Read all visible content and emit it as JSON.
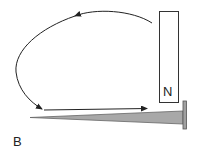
{
  "diagram": {
    "panel_label": "B",
    "magnet": {
      "pole_label": "N",
      "fill": "#ffffff",
      "stroke": "#333333"
    },
    "nail": {
      "fill": "#a8a8a8",
      "stroke": "#555555"
    },
    "field_lines": {
      "color": "#222222",
      "description": "Curved field line leaves the magnet's far end, arcs left and down to the nail tip, then a straight arrow runs along the nail toward the head"
    }
  }
}
